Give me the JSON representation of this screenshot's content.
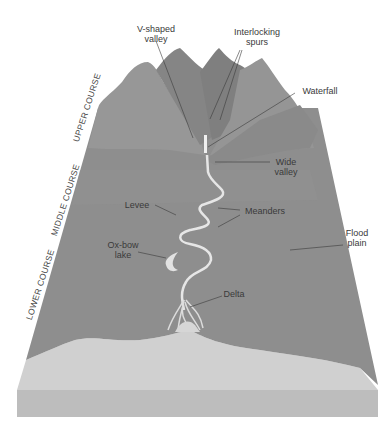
{
  "colors": {
    "background": "#ffffff",
    "upper_mountain_light": "#959595",
    "upper_mountain_dark": "#7e7e7e",
    "valley_slope": "#8a8a8a",
    "plain": "#8d8d8d",
    "sea": "#cfcfcf",
    "block_side": "#bdbdbd",
    "river": "#e3e3e3",
    "leader_line": "#3a3a3a"
  },
  "courses": [
    {
      "id": "upper",
      "label": "UPPER COURSE"
    },
    {
      "id": "middle",
      "label": "MIDDLE COURSE"
    },
    {
      "id": "lower",
      "label": "LOWER COURSE"
    }
  ],
  "labels": {
    "v_shaped_valley": {
      "line1": "V-shaped",
      "line2": "valley"
    },
    "interlocking_spurs": {
      "line1": "Interlocking",
      "line2": "spurs"
    },
    "waterfall": {
      "line1": "Waterfall"
    },
    "wide_valley": {
      "line1": "Wide",
      "line2": "valley"
    },
    "levee": {
      "line1": "Levee"
    },
    "meanders": {
      "line1": "Meanders"
    },
    "flood_plain": {
      "line1": "Flood",
      "line2": "plain"
    },
    "ox_bow_lake": {
      "line1": "Ox-bow",
      "line2": "lake"
    },
    "delta": {
      "line1": "Delta"
    }
  }
}
